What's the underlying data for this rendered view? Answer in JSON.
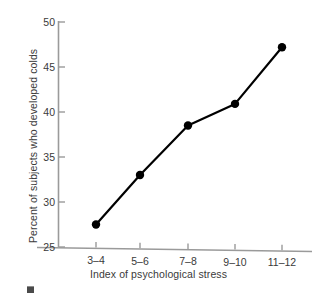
{
  "chart_data": {
    "type": "line",
    "title": "",
    "xlabel": "Index of psychological stress",
    "ylabel": "Percent of subjects who developed colds",
    "categories": [
      "3–4",
      "5–6",
      "7–8",
      "9–10",
      "11–12"
    ],
    "values": [
      27.5,
      33.0,
      38.5,
      40.9,
      47.2
    ],
    "yticks": [
      25,
      30,
      35,
      40,
      45,
      50
    ],
    "ylim": [
      25,
      50
    ],
    "grid": false,
    "legend": false,
    "marker": "filled-circle",
    "line_color": "#000000",
    "axis_color": "#8e8e8e",
    "text_color": "#3a3a3a"
  },
  "axes": {
    "y_title": "Percent of subjects who developed colds",
    "x_title": "Index of psychological stress",
    "y_tick_labels": [
      "25",
      "30",
      "35",
      "40",
      "45",
      "50"
    ],
    "x_tick_labels": [
      "3–4",
      "5–6",
      "7–8",
      "9–10",
      "11–12"
    ]
  }
}
